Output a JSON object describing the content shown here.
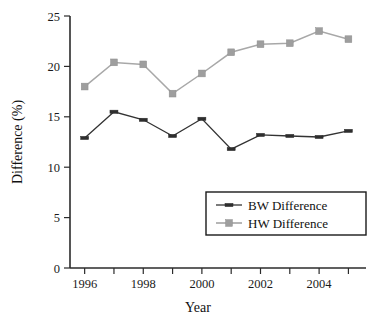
{
  "chart_data": {
    "type": "line",
    "title": "",
    "xlabel": "Year",
    "ylabel": "Difference (%)",
    "x": [
      1996,
      1997,
      1998,
      1999,
      2000,
      2001,
      2002,
      2003,
      2004,
      2005
    ],
    "xtick_labels": [
      "1996",
      "1998",
      "2000",
      "2002",
      "2004"
    ],
    "xtick_values": [
      1996,
      1998,
      2000,
      2002,
      2004
    ],
    "xlim": [
      1995.5,
      2005.6
    ],
    "ytick_labels": [
      "0",
      "5",
      "10",
      "15",
      "20",
      "25"
    ],
    "ytick_values": [
      0,
      5,
      10,
      15,
      20,
      25
    ],
    "ylim": [
      0,
      25
    ],
    "grid": false,
    "legend_position": "lower right",
    "series": [
      {
        "name": "BW Difference",
        "color": "#333333",
        "marker": "line-segment",
        "values": [
          12.9,
          15.5,
          14.7,
          13.1,
          14.8,
          11.8,
          13.2,
          13.1,
          13.0,
          13.6
        ]
      },
      {
        "name": "HW Difference",
        "color": "#9e9e9e",
        "marker": "square",
        "values": [
          18.0,
          20.4,
          20.2,
          17.3,
          19.3,
          21.4,
          22.2,
          22.3,
          23.5,
          22.7
        ]
      }
    ]
  },
  "legend": {
    "entries": [
      {
        "label": "BW Difference"
      },
      {
        "label": "HW Difference"
      }
    ]
  },
  "axes": {
    "y_title": "Difference (%)",
    "x_title": "Year"
  }
}
